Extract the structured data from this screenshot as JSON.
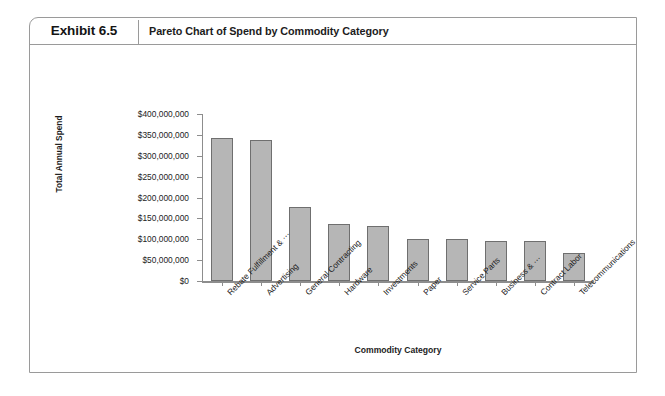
{
  "exhibit": {
    "number": "Exhibit 6.5",
    "title": "Pareto Chart of Spend by Commodity Category"
  },
  "chart_data": {
    "type": "bar",
    "title": "Pareto Chart of Spend by Commodity Category",
    "xlabel": "Commodity Category",
    "ylabel": "Total Annual Spend",
    "ylim": [
      0,
      400000000
    ],
    "ytick_labels": [
      "$400,000,000",
      "$350,000,000",
      "$300,000,000",
      "$250,000,000",
      "$200,000,000",
      "$150,000,000",
      "$100,000,000",
      "$50,000,000",
      "$0"
    ],
    "ytick_values": [
      400000000,
      350000000,
      300000000,
      250000000,
      200000000,
      150000000,
      100000000,
      50000000,
      0
    ],
    "grid": false,
    "legend": "none",
    "categories": [
      "Rebate Fulfillment & ⋯",
      "Advertising",
      "General Contracting",
      "Hardware",
      "Investments",
      "Paper",
      "Service Parts",
      "Business & ⋯",
      "Contract Labor",
      "Telecommunications"
    ],
    "values": [
      343000000,
      338000000,
      177000000,
      136000000,
      131000000,
      101000000,
      100000000,
      97000000,
      96000000,
      66000000
    ],
    "bar_color": "#b6b6b6",
    "bar_edge_color": "#6f6f6f",
    "axis_color": "#8d8d8d"
  }
}
